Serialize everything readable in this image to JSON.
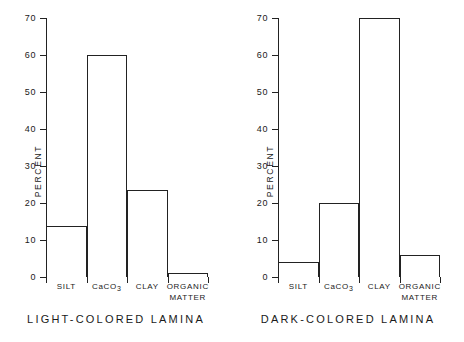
{
  "chart_data": [
    {
      "type": "bar",
      "title": "LIGHT-COLORED LAMINA",
      "xlabel": "",
      "ylabel": "PERCENT",
      "categories": [
        "SILT",
        "CaCO3",
        "CLAY",
        "ORGANIC MATTER"
      ],
      "category_labels": [
        "SILT",
        "CaCO₃",
        "CLAY",
        "ORGANIC\nMATTER"
      ],
      "values": [
        13.7,
        60,
        23.5,
        1
      ],
      "ylim": [
        0,
        70
      ],
      "yticks": [
        0,
        10,
        20,
        30,
        40,
        50,
        60,
        70
      ],
      "ytick_labels": [
        "0",
        "10",
        "20",
        "30",
        "40",
        "50",
        "60",
        "70"
      ],
      "grid": false,
      "legend": "none",
      "bar_style": "contiguous-outline"
    },
    {
      "type": "bar",
      "title": "DARK-COLORED LAMINA",
      "xlabel": "",
      "ylabel": "PERCENT",
      "categories": [
        "SILT",
        "CaCO3",
        "CLAY",
        "ORGANIC MATTER"
      ],
      "category_labels": [
        "SILT",
        "CaCO₃",
        "CLAY",
        "ORGANIC\nMATTER"
      ],
      "values": [
        4,
        20,
        70,
        6
      ],
      "ylim": [
        0,
        70
      ],
      "yticks": [
        0,
        10,
        20,
        30,
        40,
        50,
        60,
        70
      ],
      "ytick_labels": [
        "0",
        "10",
        "20",
        "30",
        "40",
        "50",
        "60",
        "70"
      ],
      "grid": false,
      "legend": "none",
      "bar_style": "contiguous-outline"
    }
  ],
  "panels": [
    {
      "id": "light",
      "caption": "LIGHT-COLORED LAMINA",
      "axis_title": "PERCENT",
      "bars": [
        {
          "label": "SILT",
          "sub": "",
          "value": 13.7
        },
        {
          "label": "CaCO",
          "sub": "3",
          "value": 60
        },
        {
          "label": "CLAY",
          "sub": "",
          "value": 23.5
        },
        {
          "label": "ORGANIC MATTER",
          "sub": "",
          "value": 1
        }
      ]
    },
    {
      "id": "dark",
      "caption": "DARK-COLORED LAMINA",
      "axis_title": "PERCENT",
      "bars": [
        {
          "label": "SILT",
          "sub": "",
          "value": 4
        },
        {
          "label": "CaCO",
          "sub": "3",
          "value": 20
        },
        {
          "label": "CLAY",
          "sub": "",
          "value": 70
        },
        {
          "label": "ORGANIC MATTER",
          "sub": "",
          "value": 6
        }
      ]
    }
  ],
  "colors": {
    "ink": "#222222",
    "background": "#ffffff",
    "bar_fill": "#ffffff"
  }
}
